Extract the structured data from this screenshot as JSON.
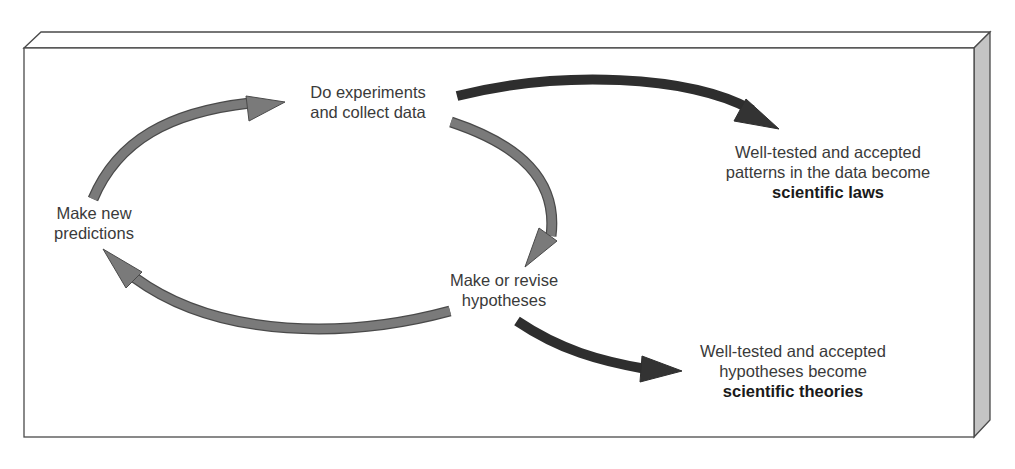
{
  "diagram": {
    "type": "cycle-flow",
    "colors": {
      "cycle_arrow": "#7a7a7a",
      "outcome_arrow": "#333333",
      "box_border": "#4a4a4a",
      "box_side": "#c4c4c4",
      "box_face": "#ffffff",
      "text": "#3a3a3a"
    },
    "nodes": {
      "experiments": {
        "line1": "Do experiments",
        "line2": "and collect data"
      },
      "hypotheses": {
        "line1": "Make or revise",
        "line2": "hypotheses"
      },
      "predictions": {
        "line1": "Make new",
        "line2": "predictions"
      },
      "laws": {
        "line1": "Well-tested and accepted",
        "line2": "patterns in the data become",
        "bold": "scientific laws"
      },
      "theories": {
        "line1": "Well-tested and accepted",
        "line2": "hypotheses become",
        "bold": "scientific theories"
      }
    },
    "edges": [
      {
        "from": "predictions",
        "to": "experiments",
        "style": "cycle"
      },
      {
        "from": "experiments",
        "to": "hypotheses",
        "style": "cycle"
      },
      {
        "from": "hypotheses",
        "to": "predictions",
        "style": "cycle"
      },
      {
        "from": "experiments",
        "to": "laws",
        "style": "outcome"
      },
      {
        "from": "hypotheses",
        "to": "theories",
        "style": "outcome"
      }
    ]
  }
}
